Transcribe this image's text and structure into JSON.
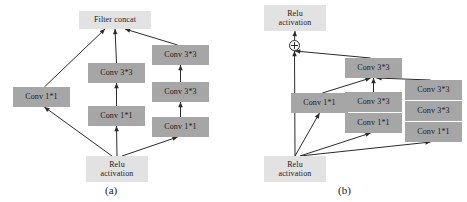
{
  "figure": {
    "background_color": "#ffffff",
    "node_fill_dark": "#a6a6a6",
    "node_fill_light": "#e2e2e2",
    "edge_color": "#2a2a2a",
    "text_color": "#1b1b1b"
  },
  "panels": [
    {
      "id": "a",
      "caption": "(a)",
      "nodes": [
        {
          "id": "a-filter-concat",
          "label": "Filter  concat",
          "style": "light",
          "x": 79,
          "y": 11,
          "w": 72,
          "h": 18
        },
        {
          "id": "a-left-conv1x1",
          "label": "Conv  1*1",
          "style": "dark",
          "x": 13,
          "y": 87,
          "w": 57,
          "h": 20
        },
        {
          "id": "a-mid-conv3x3",
          "label": "Conv  3*3",
          "style": "dark",
          "x": 88,
          "y": 63,
          "w": 57,
          "h": 20
        },
        {
          "id": "a-mid-conv1x1",
          "label": "Conv  1*1",
          "style": "dark",
          "x": 88,
          "y": 106,
          "w": 57,
          "h": 20
        },
        {
          "id": "a-right-conv3x3-top",
          "label": "Conv  3*3",
          "style": "dark",
          "x": 152,
          "y": 45,
          "w": 57,
          "h": 20
        },
        {
          "id": "a-right-conv3x3-mid",
          "label": "Conv  3*3",
          "style": "dark",
          "x": 152,
          "y": 82,
          "w": 57,
          "h": 20
        },
        {
          "id": "a-right-conv1x1",
          "label": "Conv  1*1",
          "style": "dark",
          "x": 152,
          "y": 117,
          "w": 57,
          "h": 20
        },
        {
          "id": "a-relu-bottom",
          "label": "Relu\nactivation",
          "style": "light",
          "x": 86,
          "y": 156,
          "w": 62,
          "h": 26
        }
      ],
      "edges": [
        {
          "from": "a-relu-bottom",
          "to": "a-left-conv1x1"
        },
        {
          "from": "a-relu-bottom",
          "to": "a-mid-conv1x1"
        },
        {
          "from": "a-relu-bottom",
          "to": "a-right-conv1x1"
        },
        {
          "from": "a-mid-conv1x1",
          "to": "a-mid-conv3x3"
        },
        {
          "from": "a-right-conv1x1",
          "to": "a-right-conv3x3-mid"
        },
        {
          "from": "a-right-conv3x3-mid",
          "to": "a-right-conv3x3-top"
        },
        {
          "from": "a-left-conv1x1",
          "to": "a-filter-concat"
        },
        {
          "from": "a-mid-conv3x3",
          "to": "a-filter-concat"
        },
        {
          "from": "a-right-conv3x3-top",
          "to": "a-filter-concat"
        }
      ]
    },
    {
      "id": "b",
      "caption": "(b)",
      "nodes": [
        {
          "id": "b-relu-top",
          "label": "Relu\nactivation",
          "style": "light",
          "x": 31,
          "y": 5,
          "w": 62,
          "h": 26
        },
        {
          "id": "b-sum",
          "label": "+",
          "style": "sum",
          "x": 56,
          "y": 40,
          "w": 11,
          "h": 11
        },
        {
          "id": "b-mid-conv3x3-top",
          "label": "Conv  3*3",
          "style": "dark",
          "x": 112,
          "y": 58,
          "w": 57,
          "h": 20
        },
        {
          "id": "b-left-conv1x1",
          "label": "Conv  1*1",
          "style": "dark",
          "x": 58,
          "y": 93,
          "w": 57,
          "h": 20
        },
        {
          "id": "b-mid-conv3x3",
          "label": "Conv  3*3",
          "style": "dark",
          "x": 112,
          "y": 92,
          "w": 57,
          "h": 20
        },
        {
          "id": "b-mid-conv1x1",
          "label": "Conv  1*1",
          "style": "dark",
          "x": 112,
          "y": 113,
          "w": 57,
          "h": 20
        },
        {
          "id": "b-right-conv3x3-top",
          "label": "Conv  3*3",
          "style": "dark",
          "x": 172,
          "y": 80,
          "w": 57,
          "h": 20
        },
        {
          "id": "b-right-conv3x3-mid",
          "label": "Conv  3*3",
          "style": "dark",
          "x": 172,
          "y": 101,
          "w": 57,
          "h": 20
        },
        {
          "id": "b-right-conv1x1",
          "label": "Conv  1*1",
          "style": "dark",
          "x": 172,
          "y": 122,
          "w": 57,
          "h": 20
        },
        {
          "id": "b-relu-bottom",
          "label": "Relu\nactivation",
          "style": "light",
          "x": 31,
          "y": 156,
          "w": 62,
          "h": 26
        }
      ],
      "edges": [
        {
          "from": "b-relu-bottom",
          "to": "b-sum"
        },
        {
          "from": "b-relu-bottom",
          "to": "b-left-conv1x1"
        },
        {
          "from": "b-relu-bottom",
          "to": "b-mid-conv1x1"
        },
        {
          "from": "b-relu-bottom",
          "to": "b-right-conv1x1"
        },
        {
          "from": "b-left-conv1x1",
          "to": "b-mid-conv3x3-top"
        },
        {
          "from": "b-mid-conv3x3",
          "to": "b-mid-conv3x3-top"
        },
        {
          "from": "b-right-conv3x3-top",
          "to": "b-mid-conv3x3-top"
        },
        {
          "from": "b-mid-conv3x3-top",
          "to": "b-sum"
        },
        {
          "from": "b-sum",
          "to": "b-relu-top"
        }
      ]
    }
  ]
}
